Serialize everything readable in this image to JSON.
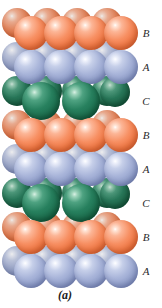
{
  "figure": {
    "caption": "(a)",
    "width": 162,
    "height": 308
  },
  "colors": {
    "layer_B": "#f78f62",
    "layer_A": "#a8b4d9",
    "layer_C": "#27805e",
    "background": "#ffffff",
    "label_text": "#2b2b2b"
  },
  "layers": [
    {
      "label": "B",
      "type": "B",
      "color": "#f78f62",
      "top": 8,
      "label_y": 27,
      "front_count": 3,
      "back_count": 3
    },
    {
      "label": "A",
      "type": "A",
      "color": "#a8b4d9",
      "top": 42,
      "label_y": 61,
      "front_count": 3,
      "back_count": 3
    },
    {
      "label": "C",
      "type": "C",
      "color": "#27805e",
      "top": 76,
      "label_y": 95,
      "front_count": 2,
      "back_count": 3
    },
    {
      "label": "B",
      "type": "B",
      "color": "#f78f62",
      "top": 110,
      "label_y": 129,
      "front_count": 3,
      "back_count": 3
    },
    {
      "label": "A",
      "type": "A",
      "color": "#a8b4d9",
      "top": 144,
      "label_y": 163,
      "front_count": 3,
      "back_count": 3
    },
    {
      "label": "C",
      "type": "C",
      "color": "#27805e",
      "top": 178,
      "label_y": 197,
      "front_count": 2,
      "back_count": 3
    },
    {
      "label": "B",
      "type": "B",
      "color": "#f78f62",
      "top": 212,
      "label_y": 231,
      "front_count": 3,
      "back_count": 3
    },
    {
      "label": "A",
      "type": "A",
      "color": "#a8b4d9",
      "top": 246,
      "label_y": 265,
      "front_count": 3,
      "back_count": 3
    }
  ],
  "stacking_sequence": "B A C B A C B A"
}
